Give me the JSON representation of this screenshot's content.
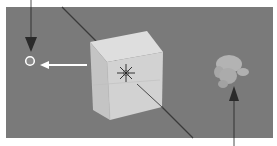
{
  "viewport": {
    "label": "3D Viewport",
    "background_color": "#7a7a7a"
  },
  "objects": [
    {
      "name": "Cube",
      "type": "mesh",
      "selected": true,
      "color": "#cfcfcf"
    },
    {
      "name": "Suzanne",
      "type": "mesh",
      "selected": false,
      "color": "#a8a8a8"
    },
    {
      "name": "3D Cursor",
      "type": "cursor"
    },
    {
      "name": "Origin point",
      "type": "origin"
    }
  ],
  "annotations": {
    "top_arrow": "arrow pointing down to origin point",
    "left_arrow": "white arrow pointing left from cube to origin point",
    "bottom_arrow": "arrow pointing up to monkey head"
  },
  "colors": {
    "axis_line": "#3a3a3a",
    "arrow": "#2a2a2a",
    "highlight_arrow": "#ffffff"
  }
}
